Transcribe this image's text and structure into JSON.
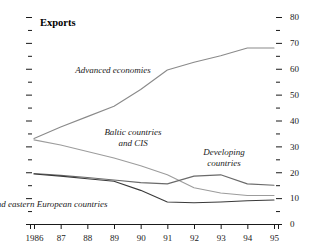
{
  "chart_data": {
    "type": "line",
    "title": "Exports",
    "xlabel": "",
    "ylabel": "",
    "x": [
      1986,
      1987,
      1988,
      1989,
      1990,
      1991,
      1992,
      1993,
      1994,
      1995
    ],
    "xticklabels": [
      "1986",
      "87",
      "88",
      "89",
      "90",
      "91",
      "92",
      "93",
      "94",
      "95"
    ],
    "ylim": [
      0,
      80
    ],
    "yticks": [
      0,
      10,
      20,
      30,
      40,
      50,
      60,
      70,
      80
    ],
    "yticklabels": [
      "0",
      "10",
      "20",
      "30",
      "40",
      "50",
      "60",
      "70",
      "80"
    ],
    "minor_tick_step": 5,
    "y_axis_position": "right",
    "grid": false,
    "legend": "inline-annotations",
    "series": [
      {
        "name": "Advanced economies",
        "color": "#8a8a8a",
        "values": [
          33.0,
          37.5,
          41.5,
          45.5,
          52.0,
          59.5,
          62.5,
          65.0,
          68.0,
          68.0
        ]
      },
      {
        "name": "Baltic countries and CIS",
        "color": "#9c9c9c",
        "values": [
          32.5,
          30.5,
          28.0,
          25.5,
          22.5,
          19.0,
          14.0,
          12.0,
          11.0,
          11.0
        ]
      },
      {
        "name": "Developing countries",
        "color": "#6a6a6a",
        "values": [
          19.5,
          18.8,
          18.0,
          17.0,
          16.0,
          15.5,
          18.5,
          19.0,
          15.5,
          15.0
        ]
      },
      {
        "name": "Central and eastern European countries",
        "color": "#3a3a3a",
        "values": [
          19.3,
          18.5,
          17.5,
          16.5,
          13.0,
          8.5,
          8.2,
          8.5,
          9.0,
          9.3
        ]
      }
    ],
    "annotations": [
      {
        "name": "advanced-economies-label",
        "text": "Advanced economies",
        "lines": [
          "Advanced economies"
        ],
        "x": 113,
        "y": 73
      },
      {
        "name": "baltic-cis-label",
        "text": "Baltic countries and CIS",
        "lines": [
          "Baltic countries",
          "and CIS"
        ],
        "x": 133,
        "y": 135
      },
      {
        "name": "developing-countries-label",
        "text": "Developing countries",
        "lines": [
          "Developing",
          "countries"
        ],
        "x": 224,
        "y": 155
      },
      {
        "name": "central-eastern-label",
        "text": "Central and eastern European countries",
        "lines": [
          "Central and eastern European countries"
        ],
        "x": 35,
        "y": 207
      }
    ]
  }
}
